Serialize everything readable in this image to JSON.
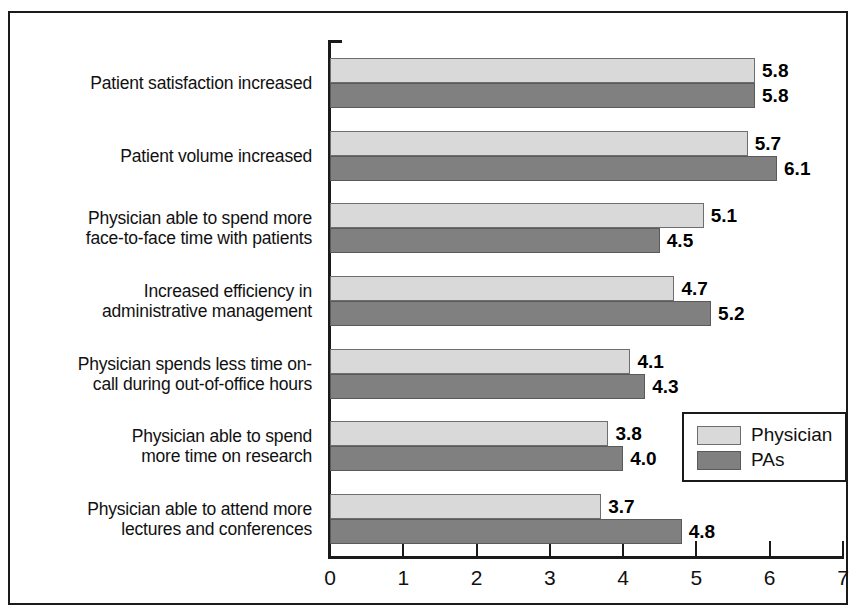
{
  "chart_data": {
    "type": "bar",
    "orientation": "horizontal",
    "title": "",
    "xlabel": "",
    "ylabel": "",
    "xlim": [
      0,
      7
    ],
    "xticks": [
      0,
      1,
      2,
      3,
      4,
      5,
      6,
      7
    ],
    "grid": false,
    "legend_position": "inside-lower-right",
    "categories": [
      "Patient satisfaction increased",
      "Patient volume increased",
      "Physician able to spend more\nface-to-face time with patients",
      "Increased efficiency in\nadministrative management",
      "Physician spends less time on-\ncall during out-of-office hours",
      "Physician able to spend\nmore time on research",
      "Physician able to attend more\nlectures and conferences"
    ],
    "series": [
      {
        "name": "Physician",
        "color": "#d9d9d9",
        "values": [
          5.8,
          5.7,
          5.1,
          4.7,
          4.1,
          3.8,
          3.7
        ],
        "labels": [
          "5.8",
          "5.7",
          "5.1",
          "4.7",
          "4.1",
          "3.8",
          "3.7"
        ]
      },
      {
        "name": "PAs",
        "color": "#808080",
        "values": [
          5.8,
          6.1,
          4.5,
          5.2,
          4.3,
          4.0,
          4.8
        ],
        "labels": [
          "5.8",
          "6.1",
          "4.5",
          "5.2",
          "4.3",
          "4.0",
          "4.8"
        ]
      }
    ]
  },
  "legend": {
    "entries": [
      {
        "label": "Physician",
        "swatch": "light"
      },
      {
        "label": "PAs",
        "swatch": "dark"
      }
    ]
  },
  "axis": {
    "tick_labels": [
      "0",
      "1",
      "2",
      "3",
      "4",
      "5",
      "6",
      "7"
    ]
  }
}
